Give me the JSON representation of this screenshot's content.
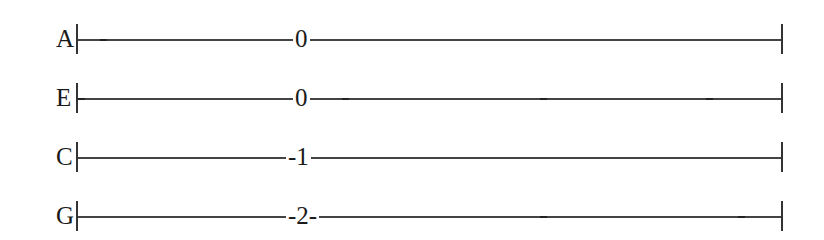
{
  "tab": {
    "strings": [
      {
        "name": "A",
        "fret": "0",
        "fret_text": "0",
        "fret_x": 293,
        "dashes": [
          103
        ]
      },
      {
        "name": "E",
        "fret": "0",
        "fret_text": "0",
        "fret_x": 293,
        "dashes": [
          78,
          346,
          543,
          709
        ]
      },
      {
        "name": "C",
        "fret": "1",
        "fret_text": "-1",
        "fret_x": 287,
        "dashes": []
      },
      {
        "name": "G",
        "fret": "2",
        "fret_text": "-2-",
        "fret_x": 287,
        "dashes": [
          543,
          741
        ]
      }
    ],
    "start_bar_x": 76,
    "end_bar_x": 781
  }
}
